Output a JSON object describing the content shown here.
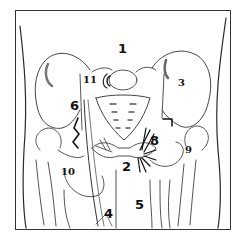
{
  "figure": {
    "labels": [
      {
        "id": "1",
        "text": "1",
        "x": 121,
        "y": 47,
        "style": "hand"
      },
      {
        "id": "3",
        "text": "3",
        "x": 179,
        "y": 78,
        "style": "serif"
      },
      {
        "id": "11",
        "text": "11",
        "x": 84,
        "y": 75,
        "style": "serif"
      },
      {
        "id": "6",
        "text": "6",
        "x": 73,
        "y": 103,
        "style": "hand"
      },
      {
        "id": "7",
        "text": "7",
        "x": 170,
        "y": 119,
        "style": "hand"
      },
      {
        "id": "8",
        "text": "8",
        "x": 152,
        "y": 139,
        "style": "hand"
      },
      {
        "id": "9",
        "text": "9",
        "x": 186,
        "y": 146,
        "style": "serif"
      },
      {
        "id": "10",
        "text": "10",
        "x": 62,
        "y": 168,
        "style": "serif"
      },
      {
        "id": "2",
        "text": "2",
        "x": 124,
        "y": 164,
        "style": "hand"
      },
      {
        "id": "4",
        "text": "4",
        "x": 106,
        "y": 211,
        "style": "hand"
      },
      {
        "id": "5",
        "text": "5",
        "x": 138,
        "y": 202,
        "style": "hand"
      }
    ]
  },
  "colors": {
    "ink": "#222222",
    "shade": "#888888",
    "background": "#ffffff"
  }
}
